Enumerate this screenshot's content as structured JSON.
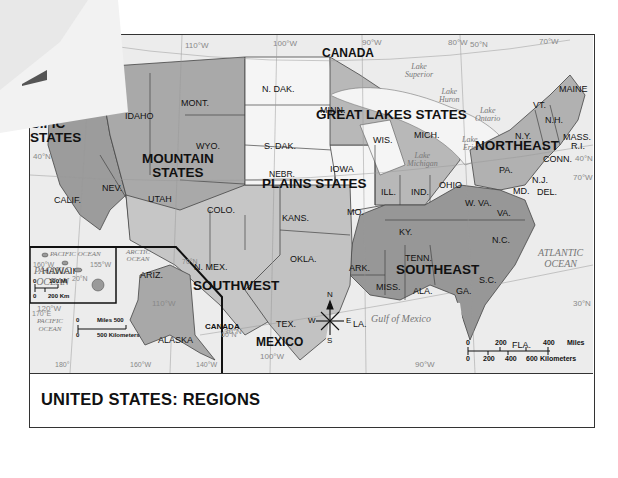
{
  "title": "UNITED STATES: REGIONS",
  "regions": {
    "pacific": "PACIFIC STATES",
    "pacific_visible_top": "CIFIC",
    "pacific_visible_bottom": "STATES",
    "mountain_line1": "MOUNTAIN",
    "mountain_line2": "STATES",
    "plains": "PLAINS STATES",
    "great_lakes": "GREAT LAKES STATES",
    "northeast": "NORTHEAST",
    "southwest": "SOUTHWEST",
    "southeast": "SOUTHEAST"
  },
  "states": {
    "idaho": "IDAHO",
    "mont": "MONT.",
    "wyo": "WYO.",
    "nev": "NEV.",
    "calif": "CALIF.",
    "utah": "UTAH",
    "colo": "COLO.",
    "ariz": "ARIZ.",
    "nmex": "N. MEX.",
    "ndak": "N. DAK.",
    "sdak": "S. DAK.",
    "nebr": "NEBR.",
    "kans": "KANS.",
    "okla": "OKLA.",
    "tex": "TEX.",
    "minn": "MINN.",
    "iowa": "IOWA",
    "mo": "MO.",
    "wis": "WIS.",
    "mich": "MICH.",
    "ill": "ILL.",
    "ind": "IND.",
    "ohio": "OHIO",
    "ark": "ARK.",
    "la": "LA.",
    "ky": "KY.",
    "tenn": "TENN.",
    "miss": "MISS.",
    "ala": "ALA.",
    "ga": "GA.",
    "fla": "FLA.",
    "sc": "S.C.",
    "nc": "N.C.",
    "va": "VA.",
    "wva": "W. VA.",
    "md": "MD.",
    "del": "DEL.",
    "pa": "PA.",
    "nj": "N.J.",
    "ny": "N.Y.",
    "conn": "CONN.",
    "vt": "VT.",
    "nh": "N.H.",
    "mass": "MASS.",
    "ri": "R.I.",
    "maine": "MAINE",
    "alaska": "ALASKA",
    "hawaii": "HAWAII"
  },
  "countries": {
    "canada": "CANADA",
    "mexico": "MEXICO",
    "canada_inset": "CANADA"
  },
  "water": {
    "pacific_ocean_1": "PACIFIC",
    "pacific_ocean_2": "OCEAN",
    "atlantic_1": "ATLANTIC",
    "atlantic_2": "OCEAN",
    "gulf": "Gulf of Mexico",
    "lake_superior_1": "Lake",
    "lake_superior_2": "Superior",
    "lake_huron_1": "Lake",
    "lake_huron_2": "Huron",
    "lake_ontario_1": "Lake",
    "lake_ontario_2": "Ontario",
    "lake_erie_1": "Lake",
    "lake_erie_2": "Erie",
    "lake_michigan_1": "Lake",
    "lake_michigan_2": "Michigan",
    "hawaii_pacific": "PACIFIC OCEAN",
    "arctic_1": "ARCTIC",
    "arctic_2": "OCEAN",
    "alaska_pacific_1": "PACIFIC",
    "alaska_pacific_2": "OCEAN"
  },
  "grid_labels": {
    "w120_top": "120°W",
    "n50_left": "50°N",
    "w110_top": "110°W",
    "w100_top": "100°W",
    "w90_top": "90°W",
    "w80_top": "80°W",
    "n50_right": "50°N",
    "w70_top": "70°W",
    "n40_left": "40°N",
    "n40_right": "40°N",
    "w70_right": "70°W",
    "w120_bottom": "120°W",
    "w110_bottom": "110°W",
    "n30_right": "30°N",
    "w90_bottom": "90°W",
    "n30_left": "30°N",
    "w100_bottom": "100°W",
    "w160_hawaii": "160°W",
    "w155_hawaii": "155°W",
    "n20_hawaii": "20°N",
    "e170": "170°E",
    "deg180": "180°",
    "w160_alaska": "160°W",
    "w140_alaska": "140°W",
    "n60_alaska": "60°N",
    "n70_alaska": "70°N"
  },
  "compass": {
    "n": "N",
    "s": "S",
    "e": "E",
    "w": "W"
  },
  "scales": {
    "main": {
      "miles_label": "Miles",
      "km_label": "Kilometers",
      "miles_ticks": [
        "0",
        "200",
        "400"
      ],
      "km_ticks": [
        "0",
        "200",
        "400",
        "600"
      ]
    },
    "hawaii": {
      "mi": "100 MI",
      "km": "200 Km",
      "zero1": "0",
      "zero2": "0"
    },
    "alaska": {
      "miles": "Miles 500",
      "km": "500 Kilometers",
      "zero1": "0",
      "zero2": "0"
    }
  },
  "colors": {
    "dark_region": "#9a9a9a",
    "medium_region": "#b4b4b4",
    "light_region": "#c8c8c8",
    "plains": "#f4f4f4",
    "water": "#ececec",
    "border": "#333333"
  }
}
